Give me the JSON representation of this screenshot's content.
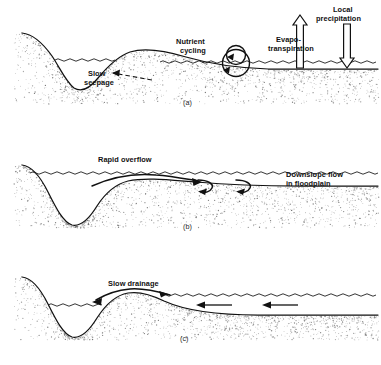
{
  "figure": {
    "background_color": "#ffffff",
    "ink_color": "#111111",
    "stipple_color": "#6f6f6f",
    "panel_count": 3
  },
  "panels": [
    {
      "id": "a",
      "caption": "(a)",
      "phase": "normal-flow",
      "labels": [
        {
          "name": "slow-seepage",
          "text_lines": [
            "Slow",
            "seepage"
          ],
          "x": 88,
          "y": 78,
          "arrow": "left",
          "arrow_style": "dashed"
        },
        {
          "name": "nutrient-cycling",
          "text_lines": [
            "Nutrient",
            "cycling"
          ],
          "x": 196,
          "y": 46,
          "arrow": "loop",
          "arrow_style": "circular"
        },
        {
          "name": "evapotranspiration",
          "text_lines": [
            "Evapo-",
            "transpiration"
          ],
          "x": 300,
          "y": 43,
          "arrow": "up",
          "arrow_style": "hollow"
        },
        {
          "name": "local-precipitation",
          "text_lines": [
            "Local",
            "precipitation"
          ],
          "x": 345,
          "y": 14,
          "arrow": "down",
          "arrow_style": "hollow"
        }
      ]
    },
    {
      "id": "b",
      "caption": "(b)",
      "phase": "flood-rising",
      "labels": [
        {
          "name": "rapid-overflow",
          "text_lines": [
            "Rapid overflow"
          ],
          "x": 100,
          "y": 164,
          "arrow": "right",
          "arrow_style": "solid-curve"
        },
        {
          "name": "downslope-flow",
          "text_lines": [
            "Downslope flow",
            "in floodplain"
          ],
          "x": 288,
          "y": 178,
          "arrow": "eddy",
          "arrow_style": "hook"
        }
      ]
    },
    {
      "id": "c",
      "caption": "(c)",
      "phase": "flood-receding",
      "labels": [
        {
          "name": "slow-drainage",
          "text_lines": [
            "Slow drainage"
          ],
          "x": 110,
          "y": 288,
          "arrow": "left",
          "arrow_style": "solid-curve"
        },
        {
          "name": "return-flow-arrows",
          "text_lines": [],
          "x": 230,
          "y": 305,
          "arrow": "left",
          "arrow_style": "straight"
        }
      ]
    }
  ],
  "text": {
    "slow": "Slow",
    "seepage": "seepage",
    "nutrient": "Nutrient",
    "cycling": "cycling",
    "evapo": "Evapo-",
    "transpiration": "transpiration",
    "local": "Local",
    "precipitation": "precipitation",
    "rapid_overflow": "Rapid overflow",
    "downslope_flow": "Downslope flow",
    "in_floodplain": "in floodplain",
    "slow_drainage": "Slow drainage",
    "caption_a": "(a)",
    "caption_b": "(b)",
    "caption_c": "(c)"
  }
}
